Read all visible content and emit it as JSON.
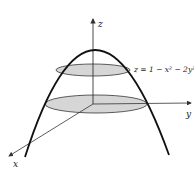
{
  "diagram": {
    "type": "3d-surface-sketch",
    "surface_equation": "z = 1 − x² − 2y²",
    "axes": {
      "x_label": "x",
      "y_label": "y",
      "z_label": "z"
    },
    "cross_sections": [
      {
        "name": "upper-level-curve",
        "shape": "ellipse",
        "fill": "#d6d6d6"
      },
      {
        "name": "lower-level-curve",
        "shape": "ellipse",
        "fill": "#d6d6d6"
      }
    ],
    "colors": {
      "curve": "#111111",
      "axis": "#333333",
      "ellipse_fill": "#d6d6d6",
      "ellipse_stroke": "#333333"
    }
  }
}
